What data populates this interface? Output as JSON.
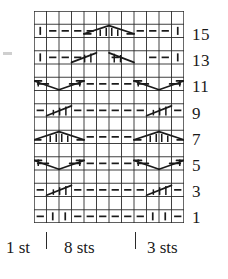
{
  "chart_data": {
    "type": "table",
    "title": "",
    "subtitle": "",
    "xlabel": "",
    "ylabel": "",
    "columns": 12,
    "rows": 16,
    "row_numbers": [
      "15",
      "13",
      "11",
      "9",
      "7",
      "5",
      "3",
      "1"
    ],
    "row_number_rows": [
      15,
      13,
      11,
      9,
      7,
      5,
      3,
      1
    ],
    "legend": [],
    "symbols": {
      "dash": "purl / horizontal dash",
      "bar": "knit / vertical bar",
      "blank": "empty cell",
      "cable": "cable crossing line"
    },
    "grid": true,
    "cells": [
      {
        "row": 16,
        "symbols": [
          "blank",
          "blank",
          "blank",
          "blank",
          "blank",
          "blank",
          "blank",
          "blank",
          "blank",
          "blank",
          "blank",
          "blank"
        ]
      },
      {
        "row": 15,
        "symbols": [
          "bar",
          "dash",
          "dash",
          "dash",
          "dash",
          "cable",
          "cable",
          "cable",
          "dash",
          "dash",
          "dash",
          "bar"
        ]
      },
      {
        "row": 14,
        "symbols": [
          "blank",
          "blank",
          "blank",
          "blank",
          "blank",
          "blank",
          "blank",
          "blank",
          "blank",
          "blank",
          "blank",
          "blank"
        ]
      },
      {
        "row": 13,
        "symbols": [
          "bar",
          "dash",
          "dash",
          "dash",
          "cable",
          "cable",
          "dash",
          "cable",
          "cable",
          "dash",
          "dash",
          "bar"
        ]
      },
      {
        "row": 12,
        "symbols": [
          "blank",
          "blank",
          "blank",
          "blank",
          "blank",
          "blank",
          "blank",
          "blank",
          "blank",
          "blank",
          "blank",
          "blank"
        ]
      },
      {
        "row": 11,
        "symbols": [
          "cable",
          "cable",
          "cable",
          "cable",
          "dash",
          "dash",
          "dash",
          "dash",
          "cable",
          "cable",
          "cable",
          "cable"
        ]
      },
      {
        "row": 10,
        "symbols": [
          "blank",
          "blank",
          "blank",
          "blank",
          "blank",
          "blank",
          "blank",
          "blank",
          "blank",
          "blank",
          "blank",
          "blank"
        ]
      },
      {
        "row": 9,
        "symbols": [
          "dash",
          "cable",
          "cable",
          "dash",
          "dash",
          "dash",
          "dash",
          "dash",
          "dash",
          "cable",
          "cable",
          "dash"
        ]
      },
      {
        "row": 8,
        "symbols": [
          "blank",
          "blank",
          "blank",
          "blank",
          "blank",
          "blank",
          "blank",
          "blank",
          "blank",
          "blank",
          "blank",
          "blank"
        ]
      },
      {
        "row": 7,
        "symbols": [
          "cable",
          "cable",
          "cable",
          "cable",
          "dash",
          "dash",
          "dash",
          "dash",
          "cable",
          "cable",
          "cable",
          "cable"
        ]
      },
      {
        "row": 6,
        "symbols": [
          "blank",
          "blank",
          "blank",
          "blank",
          "blank",
          "blank",
          "blank",
          "blank",
          "blank",
          "blank",
          "blank",
          "blank"
        ]
      },
      {
        "row": 5,
        "symbols": [
          "cable",
          "cable",
          "cable",
          "cable",
          "dash",
          "dash",
          "dash",
          "dash",
          "cable",
          "cable",
          "cable",
          "cable"
        ]
      },
      {
        "row": 4,
        "symbols": [
          "blank",
          "blank",
          "blank",
          "blank",
          "blank",
          "blank",
          "blank",
          "blank",
          "blank",
          "blank",
          "blank",
          "blank"
        ]
      },
      {
        "row": 3,
        "symbols": [
          "dash",
          "cable",
          "cable",
          "dash",
          "dash",
          "dash",
          "dash",
          "dash",
          "dash",
          "cable",
          "cable",
          "dash"
        ]
      },
      {
        "row": 2,
        "symbols": [
          "blank",
          "blank",
          "blank",
          "blank",
          "blank",
          "blank",
          "blank",
          "blank",
          "blank",
          "blank",
          "blank",
          "blank"
        ]
      },
      {
        "row": 1,
        "symbols": [
          "dash",
          "bar",
          "bar",
          "dash",
          "dash",
          "dash",
          "dash",
          "dash",
          "dash",
          "bar",
          "bar",
          "dash"
        ]
      }
    ]
  },
  "caption": {
    "segment_1": "1 st",
    "segment_2": "8 sts",
    "segment_3": "3 sts"
  },
  "colors": {
    "ink": "#1a1a1a",
    "grid_line": "#2a2a2a",
    "background": "#ffffff"
  }
}
